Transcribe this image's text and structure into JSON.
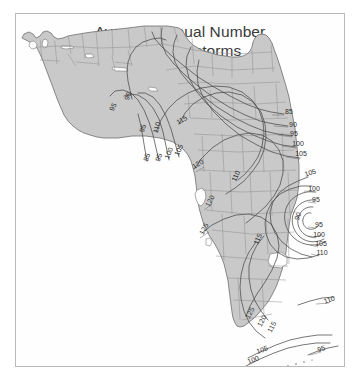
{
  "figure": {
    "kind": "contour-map",
    "width": 361,
    "height": 389,
    "background_color": "#ffffff",
    "border_color": "#b9b9b9"
  },
  "title": {
    "line1": "Average Annual Number",
    "line2": "of Thunderstorms",
    "color": "#3a3a3a"
  },
  "map": {
    "region_name": "Florida",
    "land_fill_color": "#c9c9c9",
    "land_outline_color": "#6f6f6f",
    "county_line_color": "#8e8e8e",
    "contour_line_color": "#4a4a4a",
    "water_fill_color": "#ffffff",
    "leader_line_color": "#5a5a5a"
  },
  "chart_data": {
    "type": "contour",
    "title": "Average Annual Number of Thunderstorms",
    "subtitle": "",
    "xlabel": "",
    "ylabel": "",
    "units": "thunderstorm days per year",
    "contour_interval": 5,
    "contour_levels": [
      85,
      90,
      95,
      100,
      105,
      110,
      115,
      120,
      125
    ],
    "value_range": [
      85,
      125
    ],
    "grid": false,
    "legend": "none",
    "maximum_center": {
      "label": "90",
      "note": "closed contour center, east-central Florida",
      "x": 284,
      "y": 203
    },
    "labels": [
      {
        "text": "90",
        "x": 114,
        "y": 83,
        "rot": -70
      },
      {
        "text": "95",
        "x": 99,
        "y": 94,
        "rot": -62
      },
      {
        "text": "95",
        "x": 129,
        "y": 115,
        "rot": -72
      },
      {
        "text": "110",
        "x": 143,
        "y": 114,
        "rot": -74
      },
      {
        "text": "115",
        "x": 167,
        "y": 108,
        "rot": -30
      },
      {
        "text": "85",
        "x": 133,
        "y": 144,
        "rot": -72
      },
      {
        "text": "95",
        "x": 145,
        "y": 144,
        "rot": -72
      },
      {
        "text": "100",
        "x": 155,
        "y": 140,
        "rot": -68
      },
      {
        "text": "105",
        "x": 165,
        "y": 137,
        "rot": -66
      },
      {
        "text": "120",
        "x": 183,
        "y": 152,
        "rot": -30
      },
      {
        "text": "110",
        "x": 222,
        "y": 163,
        "rot": -66
      },
      {
        "text": "120",
        "x": 196,
        "y": 188,
        "rot": -62
      },
      {
        "text": "125",
        "x": 190,
        "y": 216,
        "rot": -62
      },
      {
        "text": "115",
        "x": 244,
        "y": 226,
        "rot": -66
      },
      {
        "text": "85",
        "x": 273,
        "y": 100,
        "rot": 0
      },
      {
        "text": "90",
        "x": 277,
        "y": 113,
        "rot": 0
      },
      {
        "text": "95",
        "x": 278,
        "y": 122,
        "rot": 0
      },
      {
        "text": "100",
        "x": 282,
        "y": 132,
        "rot": 0
      },
      {
        "text": "105",
        "x": 285,
        "y": 142,
        "rot": 0
      },
      {
        "text": "105",
        "x": 295,
        "y": 161,
        "rot": -18
      },
      {
        "text": "100",
        "x": 298,
        "y": 177,
        "rot": 0
      },
      {
        "text": "95",
        "x": 300,
        "y": 188,
        "rot": 0
      },
      {
        "text": "90",
        "x": 284,
        "y": 203,
        "rot": -70
      },
      {
        "text": "95",
        "x": 303,
        "y": 213,
        "rot": 0
      },
      {
        "text": "100",
        "x": 303,
        "y": 223,
        "rot": 0
      },
      {
        "text": "105",
        "x": 305,
        "y": 232,
        "rot": 0
      },
      {
        "text": "110",
        "x": 306,
        "y": 241,
        "rot": 0
      },
      {
        "text": "125",
        "x": 236,
        "y": 300,
        "rot": -62
      },
      {
        "text": "120",
        "x": 248,
        "y": 308,
        "rot": -62
      },
      {
        "text": "115",
        "x": 258,
        "y": 314,
        "rot": -62
      },
      {
        "text": "110",
        "x": 314,
        "y": 288,
        "rot": -18
      },
      {
        "text": "105",
        "x": 247,
        "y": 338,
        "rot": -20
      },
      {
        "text": "100",
        "x": 238,
        "y": 348,
        "rot": -20
      },
      {
        "text": "95",
        "x": 306,
        "y": 337,
        "rot": -18
      }
    ]
  }
}
